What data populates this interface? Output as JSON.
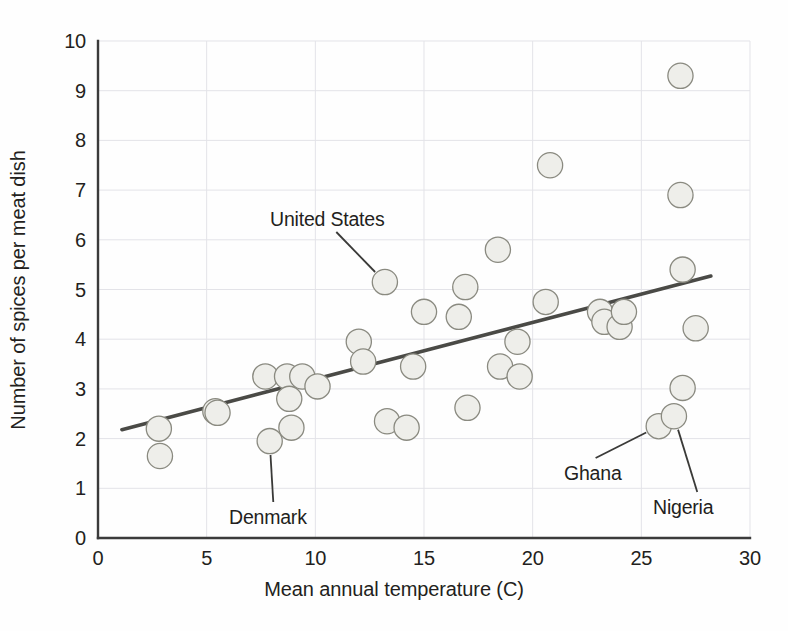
{
  "chart_data": {
    "type": "scatter",
    "title": "",
    "xlabel": "Mean annual temperature (C)",
    "ylabel": "Number of spices per meat dish",
    "xlim": [
      0,
      30
    ],
    "ylim": [
      0,
      10
    ],
    "xticks": [
      0,
      5,
      10,
      15,
      20,
      25,
      30
    ],
    "yticks": [
      0,
      1,
      2,
      3,
      4,
      5,
      6,
      7,
      8,
      9,
      10
    ],
    "grid": true,
    "legend": "none",
    "marker_fill": "#eeeeea",
    "marker_stroke": "#8a8a80",
    "trendline_color": "#4a4a46",
    "axis_color": "#3b3b3b",
    "grid_color": "#e3e3e8",
    "points": [
      {
        "x": 2.8,
        "y": 2.2
      },
      {
        "x": 2.85,
        "y": 1.65
      },
      {
        "x": 5.4,
        "y": 2.55
      },
      {
        "x": 5.5,
        "y": 2.52
      },
      {
        "x": 7.7,
        "y": 3.25
      },
      {
        "x": 7.9,
        "y": 1.95
      },
      {
        "x": 8.7,
        "y": 3.25
      },
      {
        "x": 8.8,
        "y": 2.8
      },
      {
        "x": 8.9,
        "y": 2.22
      },
      {
        "x": 9.4,
        "y": 3.25
      },
      {
        "x": 10.1,
        "y": 3.05
      },
      {
        "x": 12.0,
        "y": 3.95
      },
      {
        "x": 12.2,
        "y": 3.55
      },
      {
        "x": 13.2,
        "y": 5.15
      },
      {
        "x": 13.3,
        "y": 2.35
      },
      {
        "x": 14.2,
        "y": 2.22
      },
      {
        "x": 14.5,
        "y": 3.45
      },
      {
        "x": 15.0,
        "y": 4.55
      },
      {
        "x": 16.6,
        "y": 4.45
      },
      {
        "x": 16.9,
        "y": 5.05
      },
      {
        "x": 17.0,
        "y": 2.62
      },
      {
        "x": 18.4,
        "y": 5.8
      },
      {
        "x": 18.5,
        "y": 3.45
      },
      {
        "x": 19.3,
        "y": 3.95
      },
      {
        "x": 19.4,
        "y": 3.25
      },
      {
        "x": 20.6,
        "y": 4.75
      },
      {
        "x": 20.8,
        "y": 7.5
      },
      {
        "x": 23.1,
        "y": 4.55
      },
      {
        "x": 23.3,
        "y": 4.35
      },
      {
        "x": 24.0,
        "y": 4.25
      },
      {
        "x": 24.2,
        "y": 4.55
      },
      {
        "x": 25.8,
        "y": 2.25
      },
      {
        "x": 26.5,
        "y": 2.45
      },
      {
        "x": 26.8,
        "y": 9.3
      },
      {
        "x": 26.8,
        "y": 6.9
      },
      {
        "x": 26.9,
        "y": 5.4
      },
      {
        "x": 26.9,
        "y": 3.02
      },
      {
        "x": 27.5,
        "y": 4.22
      }
    ],
    "trendline": {
      "x1": 1.1,
      "y1": 2.18,
      "x2": 28.2,
      "y2": 5.27
    },
    "annotations": [
      {
        "label": "United States",
        "point_x": 13.2,
        "point_y": 5.15,
        "label_x": 270,
        "label_y": 208
      },
      {
        "label": "Denmark",
        "point_x": 7.9,
        "point_y": 1.95,
        "label_x": 229,
        "label_y": 506
      },
      {
        "label": "Ghana",
        "point_x": 25.8,
        "point_y": 2.25,
        "label_x": 564,
        "label_y": 462
      },
      {
        "label": "Nigeria",
        "point_x": 26.5,
        "point_y": 2.45,
        "label_x": 653,
        "label_y": 496
      }
    ]
  },
  "axes": {
    "x_tick_labels": [
      "0",
      "5",
      "10",
      "15",
      "20",
      "25",
      "30"
    ],
    "y_tick_labels": [
      "0",
      "1",
      "2",
      "3",
      "4",
      "5",
      "6",
      "7",
      "8",
      "9",
      "10"
    ],
    "x_title": "Mean annual temperature (C)",
    "y_title": "Number of spices per meat dish"
  },
  "annotations": {
    "united_states": "United States",
    "denmark": "Denmark",
    "ghana": "Ghana",
    "nigeria": "Nigeria"
  }
}
